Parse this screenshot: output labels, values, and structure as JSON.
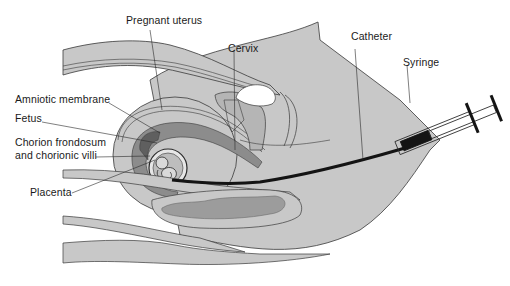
{
  "diagram": {
    "labels": {
      "pregnant_uterus": "Pregnant uterus",
      "cervix": "Cervix",
      "catheter": "Catheter",
      "syringe": "Syringe",
      "amniotic_membrane": "Amniotic membrane",
      "fetus": "Fetus",
      "chorion_line1": "Chorion frondosum",
      "chorion_line2": "and chorionic villi",
      "placenta": "Placenta"
    },
    "colors": {
      "tissue_light": "#c8c8c8",
      "tissue_mid": "#a9a9a9",
      "tissue_dark": "#6e6e6e",
      "outline": "#3a3a3a",
      "catheter": "#141414",
      "background": "#ffffff"
    }
  }
}
